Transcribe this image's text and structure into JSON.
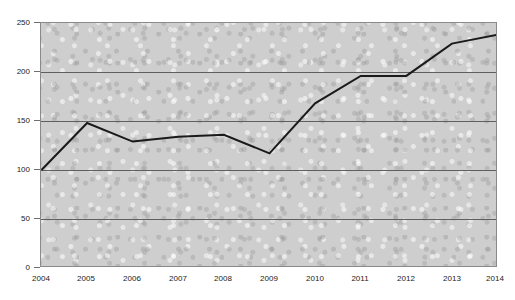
{
  "chart_data": {
    "type": "line",
    "title": "",
    "xlabel": "",
    "ylabel": "",
    "categories": [
      "2004",
      "2005",
      "2006",
      "2007",
      "2008",
      "2009",
      "2010",
      "2011",
      "2012",
      "2013",
      "2014"
    ],
    "values": [
      100,
      148,
      129,
      134,
      136,
      117,
      168,
      196,
      196,
      229,
      238
    ],
    "series": [
      {
        "name": "index",
        "values": [
          100,
          148,
          129,
          134,
          136,
          117,
          168,
          196,
          196,
          229,
          238
        ]
      }
    ],
    "ylim": [
      0,
      250
    ],
    "yticks": [
      0,
      50,
      100,
      150,
      200,
      250
    ],
    "ytick_labels": [
      "0",
      "50",
      "100",
      "150",
      "200",
      "250"
    ],
    "xtick_labels": [
      "2004",
      "2005",
      "2006",
      "2007",
      "2008",
      "2009",
      "2010",
      "2011",
      "2012",
      "2013",
      "2014"
    ],
    "grid": true,
    "grid_axis": "y",
    "legend": false,
    "legend_position": "none",
    "line_color": "#1a1a1a",
    "line_width": 2,
    "plot_background": "#cecece",
    "plot_border_color": "#8a8a8a",
    "gridline_color": "#5f5f5f",
    "axis_text_color": "#222222",
    "annotations": []
  },
  "figure": {
    "title_fragment": "",
    "background": "#ffffff"
  }
}
